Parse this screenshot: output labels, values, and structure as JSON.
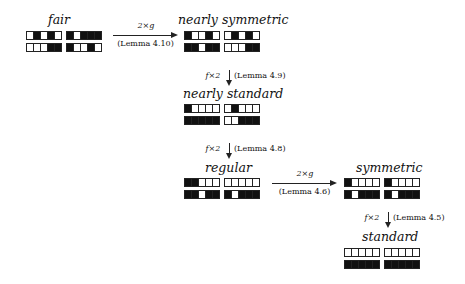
{
  "nodes": {
    "fair": {
      "label": "fair",
      "grid": [
        [
          [
            0,
            1,
            0,
            1,
            0
          ],
          [
            1,
            0,
            1,
            1,
            1
          ]
        ],
        [
          [
            0,
            0,
            0,
            1,
            1
          ],
          [
            1,
            0,
            0,
            1,
            0
          ]
        ]
      ]
    },
    "nearly_symmetric": {
      "label": "nearly symmetric",
      "grid": [
        [
          [
            1,
            0,
            0,
            1,
            0
          ],
          [
            0,
            1,
            0,
            1,
            0
          ]
        ],
        [
          [
            1,
            1,
            0,
            1,
            1
          ],
          [
            0,
            0,
            0,
            1,
            1
          ]
        ]
      ]
    },
    "nearly_standard": {
      "label": "nearly standard",
      "grid": [
        [
          [
            1,
            0,
            0,
            0,
            0
          ],
          [
            0,
            1,
            0,
            0,
            0
          ]
        ],
        [
          [
            1,
            1,
            1,
            1,
            1
          ],
          [
            0,
            0,
            1,
            1,
            1
          ]
        ]
      ]
    },
    "regular": {
      "label": "regular",
      "grid": [
        [
          [
            1,
            1,
            0,
            0,
            0
          ],
          [
            0,
            0,
            0,
            0,
            0
          ]
        ],
        [
          [
            1,
            1,
            0,
            1,
            1
          ],
          [
            1,
            0,
            1,
            1,
            1
          ]
        ]
      ]
    },
    "symmetric": {
      "label": "symmetric",
      "grid": [
        [
          [
            1,
            0,
            0,
            0,
            0
          ],
          [
            1,
            0,
            0,
            0,
            0
          ]
        ],
        [
          [
            1,
            0,
            1,
            1,
            1
          ],
          [
            1,
            0,
            1,
            1,
            1
          ]
        ]
      ]
    },
    "standard": {
      "label": "standard",
      "grid": [
        [
          [
            0,
            0,
            0,
            0,
            0
          ],
          [
            0,
            0,
            0,
            0,
            0
          ]
        ],
        [
          [
            1,
            1,
            1,
            1,
            1
          ],
          [
            1,
            1,
            1,
            1,
            1
          ]
        ]
      ]
    }
  },
  "edges": {
    "fair_to_nearly_symmetric": {
      "op": "2×g",
      "ref": "(Lemma 4.10)"
    },
    "nearly_symmetric_to_nearly_standard": {
      "op": "f×2",
      "ref": "(Lemma 4.9)"
    },
    "nearly_standard_to_regular": {
      "op": "f×2",
      "ref": "(Lemma 4.8)"
    },
    "regular_to_symmetric": {
      "op": "2×g",
      "ref": "(Lemma 4.6)"
    },
    "symmetric_to_standard": {
      "op": "f×2",
      "ref": "(Lemma 4.5)"
    }
  }
}
